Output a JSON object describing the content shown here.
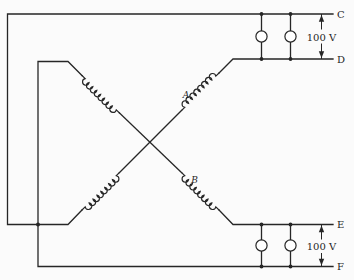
{
  "diagram": {
    "type": "circuit-schematic",
    "terminal_labels": {
      "c": "C",
      "d": "D",
      "e": "E",
      "f": "F"
    },
    "coil_labels": {
      "a": "A",
      "b": "B"
    },
    "voltage_labels": {
      "top": "100 V",
      "bottom": "100 V"
    },
    "colors": {
      "line": "#262626",
      "background": "#fbfbfb",
      "lamp_fill": "#ffffff"
    }
  }
}
